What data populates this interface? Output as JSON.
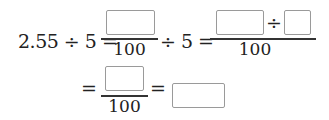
{
  "row1": {
    "lhs": "2.55 ÷ 5 =",
    "frac1": {
      "numerator_box": "",
      "denominator": "100"
    },
    "mid": "÷ 5 =",
    "frac2": {
      "numerator_box_a": "",
      "operator": "÷",
      "numerator_box_b": "",
      "denominator": "100"
    }
  },
  "row2": {
    "eq1": "=",
    "frac3": {
      "numerator_box": "",
      "denominator": "100"
    },
    "eq2": "=",
    "answer_box": ""
  }
}
